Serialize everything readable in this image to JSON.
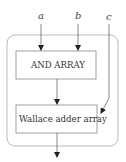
{
  "diagram": {
    "inputs": [
      {
        "id": "a",
        "label": "a"
      },
      {
        "id": "b",
        "label": "b"
      },
      {
        "id": "c",
        "label": "c"
      }
    ],
    "blocks": [
      {
        "id": "and-array",
        "label": "AND ARRAY"
      },
      {
        "id": "wallace-adder-array",
        "label": "Wallace adder array"
      }
    ],
    "edges": [
      {
        "from": "a",
        "to": "and-array"
      },
      {
        "from": "b",
        "to": "and-array"
      },
      {
        "from": "and-array",
        "to": "wallace-adder-array"
      },
      {
        "from": "c",
        "to": "wallace-adder-array"
      },
      {
        "from": "wallace-adder-array",
        "to": "output"
      }
    ],
    "colors": {
      "stroke": "#555555",
      "container": "#999999",
      "background": "#ffffff"
    }
  }
}
